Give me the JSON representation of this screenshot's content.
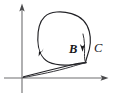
{
  "figure": {
    "kind": "phase-plane-diagram",
    "background_color": "#ffffff",
    "width": 113,
    "height": 99,
    "axes": {
      "origin": {
        "x": 22,
        "y": 78
      },
      "vertical_axis": {
        "name": "y-axis",
        "from": {
          "x": 22,
          "y": 93
        },
        "to": {
          "x": 22,
          "y": 4
        },
        "arrow": "up",
        "color": "#6e6e70"
      },
      "horizontal_axis": {
        "name": "x-axis",
        "from": {
          "x": 4,
          "y": 78
        },
        "to": {
          "x": 108,
          "y": 78
        },
        "arrow": "right",
        "color": "#6e6e70"
      }
    },
    "labels": [
      {
        "id": "B",
        "text": "B",
        "x": 69,
        "y": 43,
        "style": "bold-italic",
        "size": 12.5,
        "color": "#18181b"
      },
      {
        "id": "C",
        "text": "C",
        "x": 94,
        "y": 42,
        "style": "italic",
        "size": 12.5,
        "color": "#18181b"
      }
    ],
    "curves": [
      {
        "name": "closed-orbit",
        "description": "large closed loop (limit cycle) traversed clockwise",
        "stroke": "#222226",
        "stroke_width": 1.15
      },
      {
        "name": "inner-spiral-arc",
        "description": "short inner arc near C entering the loop",
        "stroke": "#2a2a2e",
        "stroke_width": 0.95
      },
      {
        "name": "approach-trajectory",
        "description": "trajectory from near origin running up-right to the loop",
        "stroke": "#222226",
        "stroke_width": 1.15
      }
    ],
    "flow_arrows": [
      {
        "id": "arrow-left",
        "x": 41,
        "y": 52,
        "direction": "down-left",
        "on": "closed-orbit"
      },
      {
        "id": "arrow-inner",
        "x": 82,
        "y": 48,
        "direction": "down",
        "on": "inner-spiral-arc"
      }
    ]
  }
}
